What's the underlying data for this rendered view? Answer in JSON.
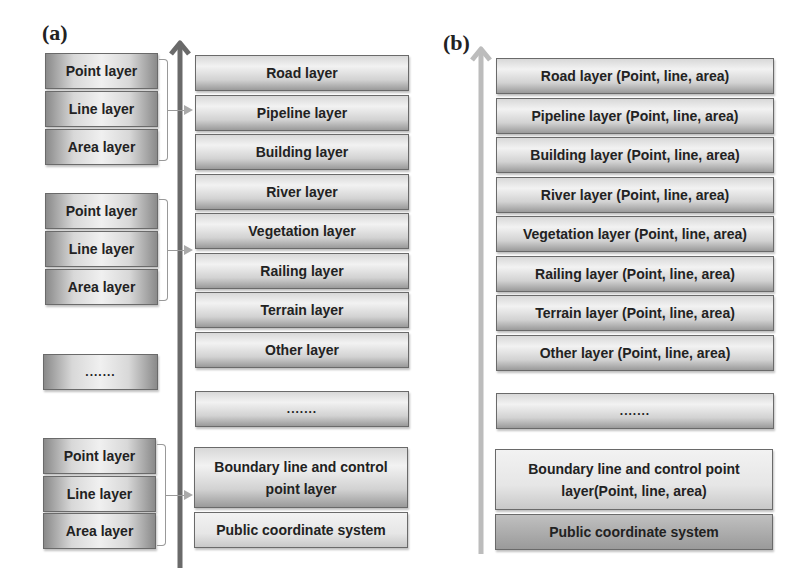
{
  "panel_a": {
    "label": "(a)",
    "left_groups": [
      [
        "Point layer",
        "Line layer",
        "Area layer"
      ],
      [
        "Point layer",
        "Line layer",
        "Area layer"
      ],
      [
        "......."
      ],
      [
        "Point layer",
        "Line layer",
        "Area layer"
      ]
    ],
    "right_layers": [
      "Road layer",
      "Pipeline layer",
      "Building layer",
      "River layer",
      "Vegetation layer",
      "Railing layer",
      "Terrain layer",
      "Other layer",
      ".......",
      "Boundary line and control point layer",
      "Public coordinate system"
    ],
    "arrow_color": "#666666"
  },
  "panel_b": {
    "label": "(b)",
    "layers": [
      "Road layer (Point, line, area)",
      "Pipeline layer (Point, line, area)",
      "Building layer (Point, line, area)",
      "River layer (Point, line, area)",
      "Vegetation layer (Point, line, area)",
      "Railing layer (Point, line, area)",
      "Terrain layer (Point, line, area)",
      "Other layer (Point, line, area)",
      ".......",
      "Boundary line and control point layer(Point, line, area)",
      "Public coordinate system"
    ],
    "arrow_color": "#bbbbbb"
  }
}
